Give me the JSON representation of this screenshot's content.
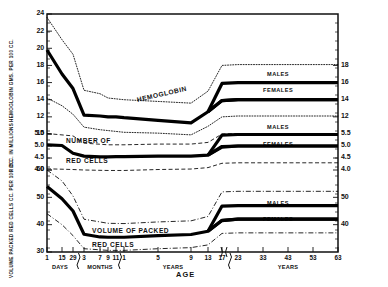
{
  "figure": {
    "xaxis_title": "AGE",
    "y_axis_titles": {
      "hemoglobin": "HEMOGLOBIN  GMS. PER 100 CC.",
      "rbc": "R.B.C. IN MILLIONS",
      "pcv": "VOLUME PACKED RED CELLS CC. PER 100 CC."
    }
  },
  "chart_data": {
    "type": "line",
    "title": "",
    "xlabel": "AGE",
    "ylabel": "",
    "grid": false,
    "legend": "inline-labels",
    "note": "Three stacked hematology reference panels sharing one non-linear age axis. Each panel shows a heavy mean curve plus dotted/dashed normal-range bands; after puberty the mean splits into MALES and FEMALES branches.",
    "x_axis": {
      "segments": [
        {
          "unit": "Days",
          "ticks": [
            "1",
            "15",
            "29"
          ]
        },
        {
          "unit": "Months",
          "ticks": [
            "3",
            "7",
            "9",
            "11"
          ]
        },
        {
          "unit": "Years",
          "ticks": [
            "1",
            "5",
            "9",
            "13",
            "17"
          ]
        },
        {
          "unit": "Years",
          "ticks": [
            "23",
            "33",
            "43",
            "53",
            "63"
          ]
        }
      ],
      "axis_break_after": "17",
      "unit_labels": [
        "Days",
        "Months",
        "Years",
        "Years"
      ]
    },
    "panels": [
      {
        "name": "hemoglobin",
        "curve_label": "HEMOGLOBIN",
        "ylabel": "HEMOGLOBIN  GMS. PER 100 CC.",
        "left_ticks": [
          24,
          22,
          20,
          18,
          16,
          14,
          12,
          10
        ],
        "right_ticks": [
          18,
          16,
          14,
          12
        ],
        "ylim": [
          10,
          24
        ],
        "units": "g/100 cc",
        "series": [
          {
            "name": "mean",
            "style": "heavy",
            "x": [
              "1d",
              "15d",
              "29d",
              "3mo",
              "7mo",
              "9mo",
              "11mo",
              "1y",
              "5y",
              "9y",
              "13y",
              "17y",
              "23y",
              "33y",
              "43y",
              "53y",
              "63y"
            ],
            "values": [
              19.8,
              17.0,
              15.3,
              12.2,
              12.1,
              12.0,
              12.0,
              11.9,
              11.6,
              11.3,
              12.6,
              13.9,
              14.0,
              14.0,
              14.0,
              14.0,
              14.0
            ]
          },
          {
            "name": "males",
            "style": "heavy",
            "x": [
              "13y",
              "17y",
              "23y",
              "33y",
              "43y",
              "53y",
              "63y"
            ],
            "values": [
              12.6,
              15.9,
              16.0,
              16.0,
              16.0,
              16.0,
              16.0
            ]
          },
          {
            "name": "females",
            "style": "heavy",
            "x": [
              "13y",
              "17y",
              "23y",
              "33y",
              "43y",
              "53y",
              "63y"
            ],
            "values": [
              12.6,
              13.9,
              14.0,
              14.0,
              14.0,
              14.0,
              14.0
            ]
          },
          {
            "name": "upper-limit",
            "style": "dotted",
            "x": [
              "1d",
              "15d",
              "29d",
              "3mo",
              "7mo",
              "9mo",
              "11mo",
              "1y",
              "5y",
              "9y",
              "13y",
              "17y",
              "23y",
              "63y"
            ],
            "values": [
              23.6,
              21.0,
              19.3,
              15.1,
              14.7,
              14.2,
              14.1,
              14.0,
              13.8,
              13.6,
              15.0,
              18.0,
              18.1,
              18.1
            ]
          },
          {
            "name": "lower-limit",
            "style": "dotted",
            "x": [
              "1d",
              "15d",
              "29d",
              "3mo",
              "7mo",
              "9mo",
              "11mo",
              "1y",
              "5y",
              "9y",
              "13y",
              "17y",
              "23y",
              "63y"
            ],
            "values": [
              14.2,
              13.3,
              12.3,
              10.8,
              10.5,
              10.4,
              10.3,
              10.2,
              10.1,
              9.9,
              10.9,
              12.0,
              12.1,
              12.1
            ]
          }
        ],
        "branch_labels": [
          "MALES",
          "FEMALES"
        ]
      },
      {
        "name": "red-cell-count",
        "curve_label": "NUMBER OF RED CELLS",
        "ylabel": "R.B.C. IN MILLIONS",
        "left_ticks": [
          5.5,
          5.0,
          4.5,
          4.0
        ],
        "right_ticks": [
          5.5,
          5.0,
          4.5,
          4.0
        ],
        "ylim": [
          4.0,
          5.5
        ],
        "units": "millions per cu mm",
        "series": [
          {
            "name": "mean",
            "style": "heavy",
            "x": [
              "1d",
              "15d",
              "29d",
              "3mo",
              "7mo",
              "9mo",
              "11mo",
              "1y",
              "5y",
              "9y",
              "13y",
              "17y",
              "23y",
              "33y",
              "43y",
              "53y",
              "63y"
            ],
            "values": [
              5.05,
              5.02,
              4.7,
              4.58,
              4.55,
              4.55,
              4.56,
              4.56,
              4.58,
              4.58,
              4.62,
              4.95,
              5.0,
              5.0,
              5.0,
              5.0,
              5.0
            ]
          },
          {
            "name": "males",
            "style": "heavy",
            "x": [
              "13y",
              "17y",
              "23y",
              "63y"
            ],
            "values": [
              4.62,
              5.45,
              5.48,
              5.48
            ]
          },
          {
            "name": "females",
            "style": "heavy",
            "x": [
              "13y",
              "17y",
              "23y",
              "63y"
            ],
            "values": [
              4.62,
              4.98,
              5.0,
              5.0
            ]
          },
          {
            "name": "upper-limit",
            "style": "dashed",
            "x": [
              "1d",
              "29d",
              "3mo",
              "9mo",
              "1y",
              "5y",
              "9y",
              "13y",
              "17y",
              "23y",
              "63y"
            ],
            "values": [
              5.52,
              5.42,
              5.12,
              5.05,
              5.05,
              5.08,
              5.08,
              5.15,
              5.5,
              5.52,
              5.52
            ]
          },
          {
            "name": "lower-limit",
            "style": "dashed",
            "x": [
              "1d",
              "29d",
              "3mo",
              "9mo",
              "1y",
              "5y",
              "9y",
              "13y",
              "17y",
              "23y",
              "63y"
            ],
            "values": [
              4.05,
              4.02,
              4.0,
              3.98,
              3.98,
              4.02,
              4.04,
              4.1,
              4.28,
              4.3,
              4.3
            ]
          }
        ],
        "branch_labels": [
          "MALES",
          "FEMALES"
        ]
      },
      {
        "name": "packed-cell-volume",
        "curve_label": "VOLUME OF PACKED RED CELLS",
        "ylabel": "VOLUME PACKED RED CELLS CC. PER 100 CC.",
        "left_ticks": [
          60,
          50,
          40,
          30
        ],
        "right_ticks": [
          50,
          40
        ],
        "ylim": [
          30,
          60
        ],
        "units": "cc per 100 cc",
        "series": [
          {
            "name": "mean",
            "style": "heavy",
            "x": [
              "1d",
              "15d",
              "29d",
              "3mo",
              "7mo",
              "9mo",
              "11mo",
              "1y",
              "5y",
              "9y",
              "13y",
              "17y",
              "23y",
              "33y",
              "43y",
              "53y",
              "63y"
            ],
            "values": [
              54.0,
              49.5,
              45.0,
              36.5,
              35.5,
              35.4,
              35.4,
              35.4,
              36.0,
              36.4,
              37.6,
              41.5,
              42.0,
              42.0,
              42.0,
              42.0,
              42.0
            ]
          },
          {
            "name": "males",
            "style": "heavy",
            "x": [
              "13y",
              "17y",
              "23y",
              "63y"
            ],
            "values": [
              37.6,
              46.8,
              47.0,
              47.0
            ]
          },
          {
            "name": "females",
            "style": "heavy",
            "x": [
              "13y",
              "17y",
              "23y",
              "63y"
            ],
            "values": [
              37.6,
              41.6,
              42.0,
              42.0
            ]
          },
          {
            "name": "upper-limit",
            "style": "dashdot",
            "x": [
              "1d",
              "15d",
              "29d",
              "3mo",
              "9mo",
              "1y",
              "5y",
              "9y",
              "13y",
              "17y",
              "23y",
              "63y"
            ],
            "values": [
              60.0,
              56.0,
              50.5,
              42.0,
              40.5,
              40.4,
              41.0,
              41.4,
              43.0,
              52.0,
              52.2,
              52.2
            ]
          },
          {
            "name": "lower-limit",
            "style": "dashdot",
            "x": [
              "1d",
              "15d",
              "29d",
              "3mo",
              "9mo",
              "1y",
              "5y",
              "9y",
              "13y",
              "17y",
              "23y",
              "63y"
            ],
            "values": [
              44.0,
              40.0,
              36.0,
              31.2,
              30.6,
              30.6,
              31.2,
              31.6,
              32.6,
              36.8,
              37.0,
              37.0
            ]
          }
        ],
        "branch_labels": [
          "MALES",
          "FEMALES"
        ]
      }
    ]
  }
}
